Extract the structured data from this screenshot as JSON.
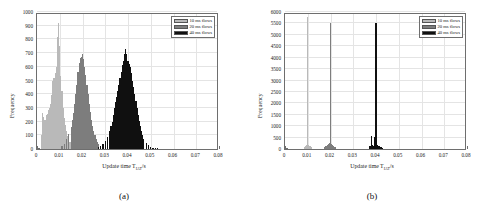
{
  "figure": {
    "panels": [
      {
        "caption": "(a)",
        "ylabel": "Frequency",
        "xlabel_main": "Update time T",
        "xlabel_sub": "IAT",
        "xlabel_tail": "/s"
      },
      {
        "caption": "(b)",
        "ylabel": "Frequency",
        "xlabel_main": "Update time T",
        "xlabel_sub": "IAT",
        "xlabel_tail": "/s"
      }
    ],
    "legend": {
      "items": [
        {
          "label": "10 ms flows",
          "color": "#b9b9b9"
        },
        {
          "label": "20 ms flows",
          "color": "#7d7d7d"
        },
        {
          "label": "40 ms flows",
          "color": "#101010"
        }
      ]
    }
  },
  "chart_data": [
    {
      "type": "bar",
      "title": "(a)",
      "subplot": "a",
      "xlabel": "Update time T_IAT/s",
      "ylabel": "Frequency",
      "xlim": [
        0,
        0.08
      ],
      "ylim": [
        0,
        1000
      ],
      "xticks": [
        0,
        0.01,
        0.02,
        0.03,
        0.04,
        0.05,
        0.06,
        0.07,
        0.08
      ],
      "xticklabels": [
        "0",
        "0.01",
        "0.02",
        "0.03",
        "0.04",
        "0.05",
        "0.06",
        "0.07",
        "0.08"
      ],
      "yticks": [
        0,
        100,
        200,
        300,
        400,
        500,
        600,
        700,
        800,
        900,
        1000
      ],
      "yticklabels": [
        "0",
        "100",
        "200",
        "300",
        "400",
        "500",
        "600",
        "700",
        "800",
        "900",
        "1000"
      ],
      "grid": true,
      "legend_position": "upper right",
      "bin_width": 0.0005,
      "series": [
        {
          "name": "10 ms flows",
          "color": "#b9b9b9",
          "x": [
            0.002,
            0.0025,
            0.003,
            0.0035,
            0.004,
            0.0045,
            0.005,
            0.0055,
            0.006,
            0.0065,
            0.007,
            0.0075,
            0.008,
            0.0085,
            0.009,
            0.0095,
            0.01,
            0.0105,
            0.011,
            0.0115,
            0.012,
            0.0125,
            0.013,
            0.0135,
            0.014,
            0.0145,
            0.015,
            0.0155,
            0.016
          ],
          "values": [
            100,
            265,
            235,
            210,
            250,
            255,
            285,
            300,
            330,
            395,
            500,
            520,
            555,
            600,
            815,
            920,
            750,
            535,
            420,
            300,
            230,
            175,
            130,
            95,
            70,
            50,
            35,
            22,
            12
          ]
        },
        {
          "name": "20 ms flows",
          "color": "#7d7d7d",
          "x": [
            0.011,
            0.012,
            0.013,
            0.014,
            0.015,
            0.0155,
            0.016,
            0.0165,
            0.017,
            0.0175,
            0.018,
            0.0185,
            0.019,
            0.0195,
            0.02,
            0.0205,
            0.021,
            0.0215,
            0.022,
            0.0225,
            0.023,
            0.0235,
            0.024,
            0.0245,
            0.025,
            0.0255,
            0.026,
            0.0265,
            0.027,
            0.028,
            0.029
          ],
          "values": [
            20,
            40,
            70,
            110,
            160,
            215,
            260,
            330,
            400,
            470,
            560,
            625,
            665,
            675,
            690,
            660,
            600,
            540,
            470,
            400,
            330,
            270,
            215,
            170,
            130,
            100,
            70,
            50,
            35,
            18,
            8
          ]
        },
        {
          "name": "40 ms flows",
          "color": "#101010",
          "x": [
            0.027,
            0.028,
            0.029,
            0.03,
            0.031,
            0.032,
            0.0325,
            0.033,
            0.0335,
            0.034,
            0.0345,
            0.035,
            0.0355,
            0.036,
            0.0365,
            0.037,
            0.0375,
            0.038,
            0.0385,
            0.039,
            0.0395,
            0.04,
            0.0405,
            0.041,
            0.0415,
            0.042,
            0.0425,
            0.043,
            0.0435,
            0.044,
            0.0445,
            0.045,
            0.0455,
            0.046,
            0.0465,
            0.047,
            0.048,
            0.049,
            0.05,
            0.051,
            0.052,
            0.053
          ],
          "values": [
            15,
            25,
            40,
            60,
            90,
            130,
            165,
            200,
            250,
            300,
            340,
            380,
            420,
            470,
            520,
            560,
            610,
            640,
            690,
            730,
            690,
            640,
            620,
            600,
            555,
            500,
            455,
            400,
            350,
            300,
            250,
            205,
            165,
            130,
            100,
            75,
            45,
            28,
            18,
            10,
            6,
            3
          ]
        }
      ]
    },
    {
      "type": "bar",
      "title": "(b)",
      "subplot": "b",
      "xlabel": "Update time T_IAT/s",
      "ylabel": "Frequency",
      "xlim": [
        0,
        0.08
      ],
      "ylim": [
        0,
        6000
      ],
      "xticks": [
        0,
        0.01,
        0.02,
        0.03,
        0.04,
        0.05,
        0.06,
        0.07,
        0.08
      ],
      "xticklabels": [
        "0",
        "0.01",
        "0.02",
        "0.03",
        "0.04",
        "0.05",
        "0.06",
        "0.07",
        "0.08"
      ],
      "yticks": [
        0,
        500,
        1000,
        1500,
        2000,
        2500,
        3000,
        3500,
        4000,
        4500,
        5000,
        5500,
        6000
      ],
      "yticklabels": [
        "0",
        "500",
        "1000",
        "1500",
        "2000",
        "2500",
        "3000",
        "3500",
        "4000",
        "4500",
        "5000",
        "5500",
        "6000"
      ],
      "grid": true,
      "legend_position": "upper right",
      "bin_width": 0.0005,
      "series": [
        {
          "name": "10 ms flows",
          "color": "#b9b9b9",
          "x": [
            0.0085,
            0.009,
            0.0095,
            0.01,
            0.0105,
            0.011,
            0.0115
          ],
          "values": [
            110,
            150,
            190,
            5800,
            180,
            140,
            95
          ]
        },
        {
          "name": "20 ms flows",
          "color": "#7d7d7d",
          "x": [
            0.0175,
            0.018,
            0.0185,
            0.019,
            0.0195,
            0.02,
            0.0205,
            0.021,
            0.0215,
            0.022
          ],
          "values": [
            90,
            130,
            170,
            210,
            250,
            5520,
            240,
            190,
            150,
            110
          ]
        },
        {
          "name": "40 ms flows",
          "color": "#101010",
          "x": [
            0.037,
            0.0375,
            0.038,
            0.0385,
            0.039,
            0.0395,
            0.04,
            0.0405,
            0.041,
            0.0415,
            0.042,
            0.0425,
            0.043
          ],
          "values": [
            120,
            150,
            560,
            180,
            150,
            520,
            5520,
            170,
            150,
            130,
            110,
            80,
            50
          ]
        }
      ]
    }
  ]
}
